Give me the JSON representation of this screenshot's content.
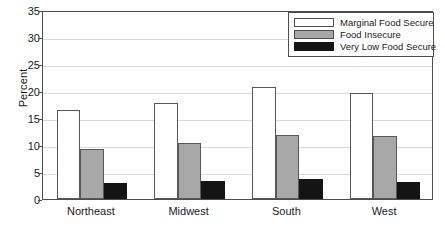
{
  "chart_data": {
    "type": "bar",
    "title": "",
    "xlabel": "",
    "ylabel": "Percent",
    "ylim": [
      0,
      35
    ],
    "ytick_step": 5,
    "yticks": [
      0,
      5,
      10,
      15,
      20,
      25,
      30,
      35
    ],
    "grid": true,
    "legend_position": "top-right",
    "categories": [
      "Northeast",
      "Midwest",
      "South",
      "West"
    ],
    "series": [
      {
        "name": "Marginal Food Secure",
        "color": "#ffffff",
        "values": [
          16.5,
          17.8,
          20.8,
          19.7
        ]
      },
      {
        "name": "Food Insecure",
        "color": "#a8a8a8",
        "values": [
          9.2,
          10.3,
          11.9,
          11.6
        ]
      },
      {
        "name": "Very Low Food Secure",
        "color": "#141414",
        "values": [
          2.9,
          3.4,
          3.7,
          3.2
        ]
      }
    ]
  },
  "legend": {
    "items": [
      {
        "label": "Marginal Food Secure"
      },
      {
        "label": "Food Insecure"
      },
      {
        "label": "Very Low Food Secure"
      }
    ]
  }
}
